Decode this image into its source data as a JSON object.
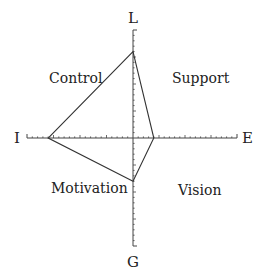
{
  "diagram": {
    "type": "radar",
    "axes": {
      "top": "L",
      "bottom": "G",
      "left": "I",
      "right": "E"
    },
    "quadrants": {
      "top_left": "Control",
      "top_right": "Support",
      "bottom_left": "Motivation",
      "bottom_right": "Vision"
    },
    "scale_max": 10,
    "ticks_per_half_axis": 20,
    "values": {
      "L": 8,
      "E": 2,
      "G": 4,
      "I": 8
    },
    "colors": {
      "line": "#333333",
      "axis": "#444444"
    }
  }
}
